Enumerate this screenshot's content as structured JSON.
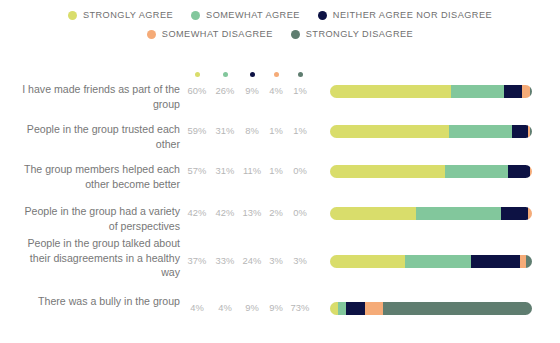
{
  "legend": {
    "rows": [
      [
        {
          "label": "STRONGLY AGREE",
          "color": "#d9dd6b",
          "icon": "legend-dot-icon"
        },
        {
          "label": "SOMEWHAT AGREE",
          "color": "#82c79c",
          "icon": "legend-dot-icon"
        },
        {
          "label": "NEITHER AGREE NOR DISAGREE",
          "color": "#0d1244",
          "icon": "legend-dot-icon"
        }
      ],
      [
        {
          "label": "SOMEWHAT DISAGREE",
          "color": "#f5ab78",
          "icon": "legend-dot-icon"
        },
        {
          "label": "STRONGLY DISAGREE",
          "color": "#5f7d70",
          "icon": "legend-dot-icon"
        }
      ]
    ]
  },
  "column_headers": [
    {
      "name": "strongly-agree",
      "color": "#d9dd6b"
    },
    {
      "name": "somewhat-agree",
      "color": "#82c79c"
    },
    {
      "name": "neither-agree-nor-disagree",
      "color": "#0d1244"
    },
    {
      "name": "somewhat-disagree",
      "color": "#f5ab78"
    },
    {
      "name": "strongly-disagree",
      "color": "#5f7d70"
    }
  ],
  "rows": [
    {
      "label": "I have made friends as part of the group",
      "pcts": [
        "60%",
        "26%",
        "9%",
        "4%",
        "1%"
      ],
      "values": [
        60,
        26,
        9,
        4,
        1
      ]
    },
    {
      "label": "People in the group trusted each other",
      "pcts": [
        "59%",
        "31%",
        "8%",
        "1%",
        "1%"
      ],
      "values": [
        59,
        31,
        8,
        1,
        1
      ]
    },
    {
      "label": "The group members helped each other become better",
      "pcts": [
        "57%",
        "31%",
        "11%",
        "1%",
        "0%"
      ],
      "values": [
        57,
        31,
        11,
        1,
        0
      ]
    },
    {
      "label": "People in the group had a variety of perspectives",
      "pcts": [
        "42%",
        "42%",
        "13%",
        "2%",
        "0%"
      ],
      "values": [
        42,
        42,
        13,
        2,
        0
      ]
    },
    {
      "label": "People in the group talked about their disagreements in a healthy way",
      "pcts": [
        "37%",
        "33%",
        "24%",
        "3%",
        "3%"
      ],
      "values": [
        37,
        33,
        24,
        3,
        3
      ]
    },
    {
      "label": "There was a bully in the group",
      "pcts": [
        "4%",
        "4%",
        "9%",
        "9%",
        "73%"
      ],
      "values": [
        4,
        4,
        9,
        9,
        73
      ]
    }
  ],
  "chart_data": {
    "type": "bar",
    "title": "",
    "xlabel": "",
    "ylabel": "",
    "stacked": true,
    "orientation": "horizontal",
    "units": "percent",
    "xlim": [
      0,
      100
    ],
    "grid": false,
    "legend_position": "top",
    "categories": [
      "I have made friends as part of the group",
      "People in the group trusted each other",
      "The group members helped each other become better",
      "People in the group had a variety of perspectives",
      "People in the group talked about their disagreements in a healthy way",
      "There was a bully in the group"
    ],
    "series": [
      {
        "name": "STRONGLY AGREE",
        "color": "#d9dd6b",
        "values": [
          60,
          59,
          57,
          42,
          37,
          4
        ]
      },
      {
        "name": "SOMEWHAT AGREE",
        "color": "#82c79c",
        "values": [
          26,
          31,
          31,
          42,
          33,
          4
        ]
      },
      {
        "name": "NEITHER AGREE NOR DISAGREE",
        "color": "#0d1244",
        "values": [
          9,
          8,
          11,
          13,
          24,
          9
        ]
      },
      {
        "name": "SOMEWHAT DISAGREE",
        "color": "#f5ab78",
        "values": [
          4,
          1,
          1,
          2,
          3,
          9
        ]
      },
      {
        "name": "STRONGLY DISAGREE",
        "color": "#5f7d70",
        "values": [
          1,
          1,
          0,
          0,
          3,
          73
        ]
      }
    ]
  },
  "layout": {
    "row_tops": [
      0,
      40,
      80,
      122,
      162,
      212
    ],
    "row_label_tops": [
      4,
      44,
      84,
      126,
      158,
      216
    ],
    "bar_tops": [
      7,
      47,
      87,
      129,
      177,
      224
    ],
    "pct_tops": [
      6,
      46,
      86,
      128,
      176,
      223
    ],
    "col_x": [
      0,
      28,
      55,
      79,
      103
    ]
  }
}
